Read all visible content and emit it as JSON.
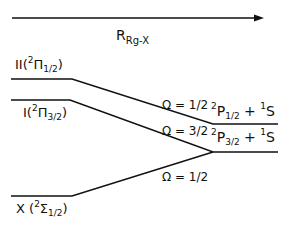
{
  "axis": {
    "label_main": "R",
    "label_sub": "Rg-X"
  },
  "states_left": [
    {
      "roman": "II(",
      "sup": "2",
      "sym": "Π",
      "sub": "1/2",
      "close": ")"
    },
    {
      "roman": "I(",
      "sup": "2",
      "sym": "Π",
      "sub": "3/2",
      "close": ")"
    },
    {
      "roman": "X (",
      "sup": "2",
      "sym": "Σ",
      "sub": "1/2",
      "close": ")"
    }
  ],
  "omega_labels": [
    "Ω = 1/2",
    "Ω = 3/2",
    "Ω = 1/2"
  ],
  "asymptotes": [
    {
      "sup1": "2",
      "term": "P",
      "sub": "1/2",
      "plus": " + ",
      "sup2": "1",
      "term2": "S"
    },
    {
      "sup1": "2",
      "term": "P",
      "sub": "3/2",
      "plus": " + ",
      "sup2": "1",
      "term2": "S"
    }
  ]
}
